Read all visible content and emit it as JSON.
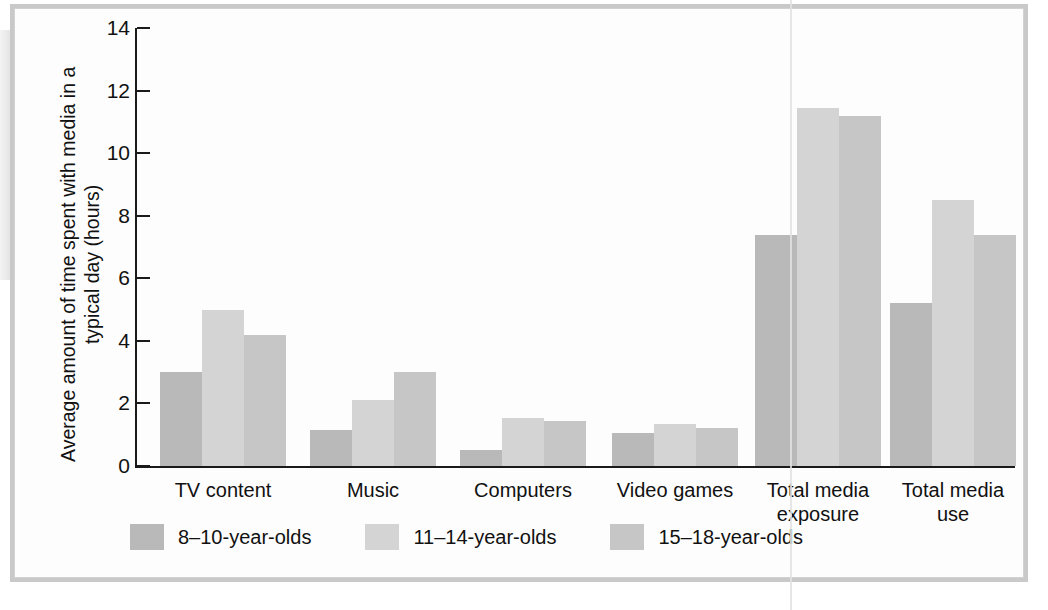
{
  "chart_data": {
    "type": "bar",
    "title": "",
    "xlabel": "",
    "ylabel": "Average amount of time spent with media in a typical day (hours)",
    "ylim": [
      0,
      14
    ],
    "yticks": [
      "0",
      "2",
      "4",
      "6",
      "8",
      "10",
      "12",
      "14"
    ],
    "ytick_values": [
      0,
      2,
      4,
      6,
      8,
      10,
      12,
      14
    ],
    "grid": false,
    "legend_position": "bottom-left",
    "categories": [
      "TV content",
      "Music",
      "Computers",
      "Video games",
      "Total media\nexposure",
      "Total media\nuse"
    ],
    "series": [
      {
        "name": "8–10-year-olds",
        "color": "#b9b9b9",
        "values": [
          3.0,
          1.15,
          0.5,
          1.05,
          7.4,
          5.2
        ]
      },
      {
        "name": "11–14-year-olds",
        "color": "#d4d4d4",
        "values": [
          5.0,
          2.1,
          1.55,
          1.35,
          11.45,
          8.5
        ]
      },
      {
        "name": "15–18-year-olds",
        "color": "#c6c6c6",
        "values": [
          4.2,
          3.0,
          1.45,
          1.2,
          11.2,
          7.4
        ]
      }
    ]
  },
  "style": {
    "axis_color": "#1a1a1a",
    "text_color": "#111111",
    "background": "#fdfdfd",
    "frame_color": "#c9c9c9"
  }
}
